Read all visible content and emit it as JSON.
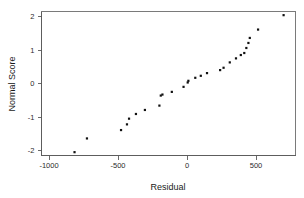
{
  "chart_data": {
    "type": "scatter",
    "title": "",
    "subtitle": "",
    "xlabel": "Residual",
    "ylabel": "Normal Score",
    "xlim": [
      -1130,
      720
    ],
    "ylim": [
      -2.35,
      2.25
    ],
    "xticks": [
      -1000,
      -500,
      0,
      500
    ],
    "xtick_labels": [
      "-1000",
      "-500",
      "0",
      "500"
    ],
    "yticks": [
      -2,
      -1,
      0,
      1,
      2
    ],
    "ytick_labels": [
      "-2",
      "-1",
      "0",
      "1",
      "2"
    ],
    "grid": false,
    "legend": null,
    "legend_position": "none",
    "marker": "square",
    "marker_color": "#111111",
    "marker_size": 2.2,
    "series": [
      {
        "name": "Residual vs Normal Score",
        "points": [
          {
            "x": -815,
            "y": -2.05
          },
          {
            "x": -725,
            "y": -1.64
          },
          {
            "x": -478,
            "y": -1.39
          },
          {
            "x": -435,
            "y": -1.22
          },
          {
            "x": -420,
            "y": -1.05
          },
          {
            "x": -370,
            "y": -0.91
          },
          {
            "x": -305,
            "y": -0.79
          },
          {
            "x": -200,
            "y": -0.66
          },
          {
            "x": -190,
            "y": -0.36
          },
          {
            "x": -178,
            "y": -0.33
          },
          {
            "x": -110,
            "y": -0.25
          },
          {
            "x": -25,
            "y": -0.1
          },
          {
            "x": 5,
            "y": 0.03
          },
          {
            "x": 10,
            "y": 0.08
          },
          {
            "x": 60,
            "y": 0.17
          },
          {
            "x": 100,
            "y": 0.23
          },
          {
            "x": 145,
            "y": 0.31
          },
          {
            "x": 240,
            "y": 0.4
          },
          {
            "x": 265,
            "y": 0.47
          },
          {
            "x": 310,
            "y": 0.63
          },
          {
            "x": 355,
            "y": 0.75
          },
          {
            "x": 390,
            "y": 0.85
          },
          {
            "x": 415,
            "y": 0.91
          },
          {
            "x": 430,
            "y": 1.06
          },
          {
            "x": 445,
            "y": 1.21
          },
          {
            "x": 455,
            "y": 1.36
          },
          {
            "x": 515,
            "y": 1.61
          },
          {
            "x": 700,
            "y": 2.04
          }
        ]
      }
    ]
  },
  "axes": {
    "x_title": "Residual",
    "y_title": "Normal Score"
  }
}
